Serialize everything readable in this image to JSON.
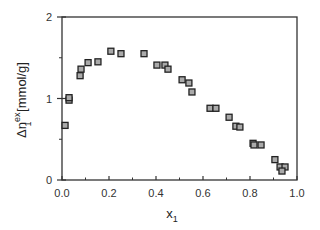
{
  "chart_data": {
    "type": "scatter",
    "title": "",
    "xlabel": "x",
    "xlabel_sub": "1",
    "ylabel_prefix": "Δn",
    "ylabel_sup": "ex",
    "ylabel_sub": "1",
    "ylabel_units": "[mmol/g]",
    "xlim": [
      0,
      1
    ],
    "ylim": [
      0,
      2
    ],
    "x_ticks": [
      "0.0",
      "0.2",
      "0.4",
      "0.6",
      "0.8",
      "1.0"
    ],
    "y_ticks": [
      "0",
      "1",
      "2"
    ],
    "grid": false,
    "legend": null,
    "marker": "square",
    "series": [
      {
        "name": "data",
        "points": [
          [
            0.013,
            0.67
          ],
          [
            0.03,
            0.98
          ],
          [
            0.03,
            1.01
          ],
          [
            0.077,
            1.28
          ],
          [
            0.081,
            1.36
          ],
          [
            0.111,
            1.44
          ],
          [
            0.153,
            1.45
          ],
          [
            0.208,
            1.58
          ],
          [
            0.251,
            1.55
          ],
          [
            0.349,
            1.55
          ],
          [
            0.404,
            1.41
          ],
          [
            0.438,
            1.41
          ],
          [
            0.451,
            1.36
          ],
          [
            0.511,
            1.23
          ],
          [
            0.54,
            1.19
          ],
          [
            0.553,
            1.08
          ],
          [
            0.63,
            0.88
          ],
          [
            0.655,
            0.88
          ],
          [
            0.711,
            0.77
          ],
          [
            0.74,
            0.66
          ],
          [
            0.757,
            0.65
          ],
          [
            0.813,
            0.45
          ],
          [
            0.817,
            0.43
          ],
          [
            0.847,
            0.43
          ],
          [
            0.906,
            0.25
          ],
          [
            0.928,
            0.16
          ],
          [
            0.949,
            0.16
          ],
          [
            0.936,
            0.11
          ]
        ]
      }
    ]
  }
}
